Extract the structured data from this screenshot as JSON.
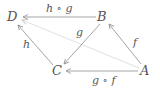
{
  "diagram": {
    "type": "commutative-diagram",
    "nodes": [
      {
        "id": "D",
        "label": "D",
        "x": 14,
        "y": 17
      },
      {
        "id": "B",
        "label": "B",
        "x": 103,
        "y": 17
      },
      {
        "id": "C",
        "label": "C",
        "x": 58,
        "y": 71
      },
      {
        "id": "A",
        "label": "A",
        "x": 145,
        "y": 71
      }
    ],
    "edges": [
      {
        "from": "B",
        "to": "D",
        "label": "h ∘ g"
      },
      {
        "from": "B",
        "to": "C",
        "label": "g"
      },
      {
        "from": "C",
        "to": "D",
        "label": "h"
      },
      {
        "from": "A",
        "to": "B",
        "label": "f"
      },
      {
        "from": "A",
        "to": "C",
        "label": "g ∘ f"
      },
      {
        "from": "A",
        "to": "D",
        "label": "",
        "style": "faint"
      }
    ],
    "colors": {
      "line": "#9a9a9a",
      "faint": "#e2e2e2",
      "text": "#555555"
    }
  }
}
